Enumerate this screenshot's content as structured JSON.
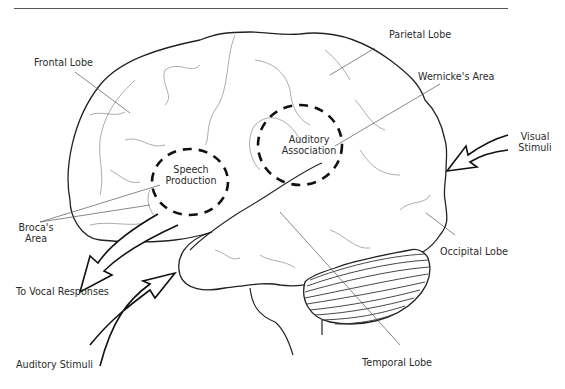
{
  "figure": {
    "labels": {
      "frontal_lobe": "Frontal Lobe",
      "parietal_lobe": "Parietal Lobe",
      "wernickes_area": "Wernicke's Area",
      "visual_stimuli_line1": "Visual",
      "visual_stimuli_line2": "Stimuli",
      "speech_production_line1": "Speech",
      "speech_production_line2": "Production",
      "auditory_association_line1": "Auditory",
      "auditory_association_line2": "Association",
      "brocas_area_line1": "Broca's",
      "brocas_area_line2": "Area",
      "to_vocal_responses": "To Vocal Responses",
      "occipital_lobe": "Occipital Lobe",
      "auditory_stimuli": "Auditory Stimuli",
      "temporal_lobe": "Temporal Lobe"
    },
    "regions": [
      {
        "name": "Speech Production",
        "marker": "dashed-circle"
      },
      {
        "name": "Auditory Association",
        "marker": "dashed-circle"
      }
    ],
    "arrows": [
      {
        "name": "Visual Stimuli",
        "direction": "inward"
      },
      {
        "name": "Auditory Stimuli",
        "direction": "inward"
      },
      {
        "name": "To Vocal Responses",
        "direction": "outward"
      }
    ],
    "colors": {
      "line": "#222222",
      "fine_line": "#777777",
      "background": "#ffffff"
    }
  }
}
